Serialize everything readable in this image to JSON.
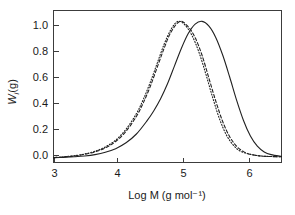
{
  "figure": {
    "background_color": "#ffffff",
    "width": 295,
    "height": 215
  },
  "chart_data": {
    "type": "line",
    "title": "",
    "subtitle": "",
    "xlabel": "Log M (g mol⁻¹)",
    "ylabel": "Wᵢ(g)",
    "ylabel_parts": {
      "symbol": "W",
      "subscript": "i",
      "suffix": "(g)"
    },
    "xlim": [
      3.15,
      6.45
    ],
    "ylim": [
      -0.03,
      1.09
    ],
    "xticks": [
      3,
      4,
      5,
      6
    ],
    "xtick_labels": [
      "3",
      "4",
      "5",
      "6"
    ],
    "yticks": [
      0.0,
      0.2,
      0.4,
      0.6,
      0.8,
      1.0
    ],
    "ytick_labels": [
      "0.0",
      "0.2",
      "0.4",
      "0.6",
      "0.8",
      "1.0"
    ],
    "grid": false,
    "legend": "none",
    "legend_position": "none",
    "annotations": [],
    "line_color": "#202020",
    "series": [
      {
        "name": "solid curve",
        "linestyle": "solid",
        "peak_x": 5.3,
        "peak_y": 1.01,
        "x": [
          3.15,
          3.3,
          3.45,
          3.6,
          3.75,
          3.9,
          4.05,
          4.2,
          4.35,
          4.5,
          4.6,
          4.7,
          4.8,
          4.9,
          5.0,
          5.1,
          5.2,
          5.3,
          5.4,
          5.5,
          5.6,
          5.7,
          5.8,
          5.9,
          6.0,
          6.1,
          6.2,
          6.3,
          6.45
        ],
        "values": [
          0.005,
          0.008,
          0.012,
          0.018,
          0.028,
          0.045,
          0.072,
          0.115,
          0.18,
          0.275,
          0.35,
          0.44,
          0.55,
          0.68,
          0.81,
          0.92,
          0.99,
          1.01,
          0.975,
          0.89,
          0.76,
          0.6,
          0.43,
          0.28,
          0.165,
          0.09,
          0.048,
          0.028,
          0.015
        ]
      },
      {
        "name": "dashed curve",
        "linestyle": "dashed",
        "peak_x": 4.98,
        "peak_y": 1.01,
        "x": [
          3.15,
          3.3,
          3.45,
          3.6,
          3.75,
          3.9,
          4.05,
          4.2,
          4.35,
          4.45,
          4.55,
          4.65,
          4.75,
          4.85,
          4.98,
          5.1,
          5.2,
          5.3,
          5.4,
          5.5,
          5.6,
          5.7,
          5.8,
          5.9,
          6.0,
          6.15,
          6.3,
          6.45
        ],
        "values": [
          0.006,
          0.011,
          0.018,
          0.03,
          0.048,
          0.078,
          0.125,
          0.2,
          0.31,
          0.41,
          0.53,
          0.67,
          0.81,
          0.93,
          1.01,
          0.97,
          0.89,
          0.76,
          0.59,
          0.42,
          0.27,
          0.16,
          0.09,
          0.05,
          0.03,
          0.018,
          0.014,
          0.012
        ]
      },
      {
        "name": "dotted curve",
        "linestyle": "dotted",
        "peak_x": 4.95,
        "peak_y": 1.01,
        "x": [
          3.15,
          3.3,
          3.45,
          3.6,
          3.75,
          3.9,
          4.05,
          4.2,
          4.35,
          4.45,
          4.55,
          4.65,
          4.75,
          4.85,
          4.95,
          5.05,
          5.15,
          5.25,
          5.35,
          5.45,
          5.55,
          5.65,
          5.75,
          5.85,
          6.0,
          6.15,
          6.3,
          6.45
        ],
        "values": [
          0.006,
          0.012,
          0.02,
          0.033,
          0.053,
          0.085,
          0.135,
          0.215,
          0.33,
          0.435,
          0.56,
          0.7,
          0.84,
          0.95,
          1.01,
          0.985,
          0.91,
          0.79,
          0.63,
          0.455,
          0.295,
          0.175,
          0.1,
          0.055,
          0.03,
          0.018,
          0.014,
          0.012
        ]
      }
    ]
  }
}
